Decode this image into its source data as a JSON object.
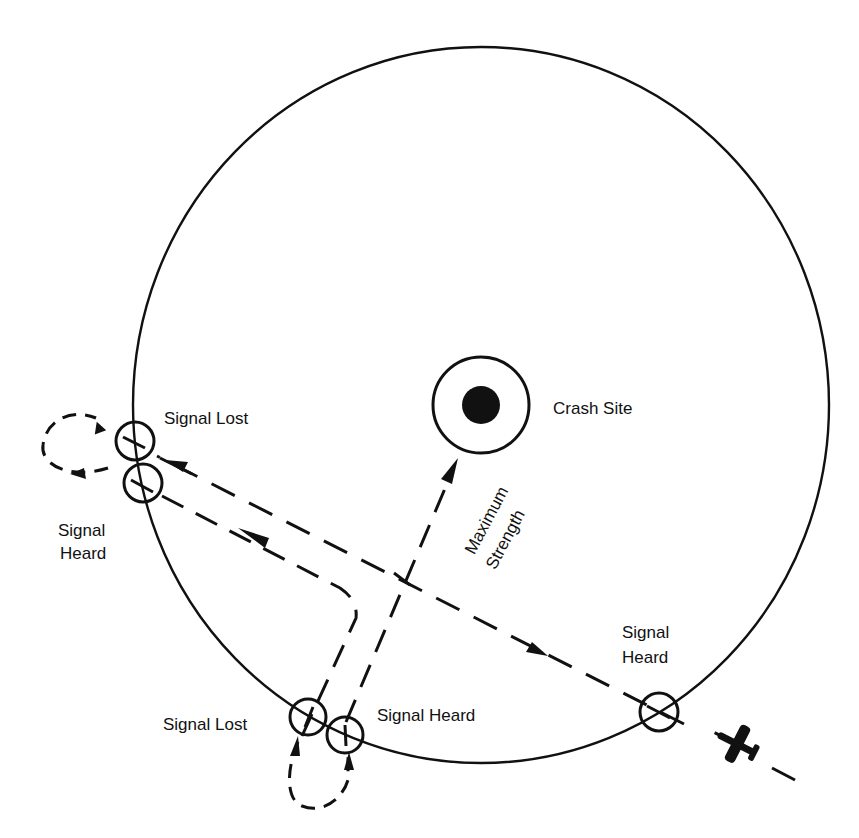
{
  "diagram": {
    "colors": {
      "ink": "#111111",
      "background": "#ffffff"
    },
    "labels": {
      "crash_site": "Crash Site",
      "max_strength_line1": "Maximum",
      "max_strength_line2": "Strength",
      "left_signal_lost": "Signal Lost",
      "left_signal_heard_line1": "Signal",
      "left_signal_heard_line2": "Heard",
      "bottom_signal_lost": "Signal Lost",
      "bottom_signal_heard": "Signal Heard",
      "right_signal_heard_line1": "Signal",
      "right_signal_heard_line2": "Heard"
    },
    "nodes": [
      {
        "id": "reception-boundary",
        "shape": "circle",
        "cx": 481,
        "cy": 405,
        "r": 352
      },
      {
        "id": "crash-site",
        "shape": "bullseye",
        "cx": 481,
        "cy": 405,
        "r": 48
      },
      {
        "id": "left-signal-lost",
        "shape": "marker-circle",
        "cx": 135,
        "cy": 441
      },
      {
        "id": "left-signal-heard",
        "shape": "marker-circle",
        "cx": 143,
        "cy": 483
      },
      {
        "id": "bottom-signal-lost",
        "shape": "marker-circle",
        "cx": 308,
        "cy": 717
      },
      {
        "id": "bottom-signal-heard",
        "shape": "marker-circle",
        "cx": 345,
        "cy": 735
      },
      {
        "id": "right-signal-heard",
        "shape": "marker-circle",
        "cx": 659,
        "cy": 712
      },
      {
        "id": "aircraft",
        "shape": "airplane-icon",
        "cx": 738,
        "cy": 744
      }
    ],
    "edges": [
      {
        "from": "aircraft",
        "to": "left-signal-lost",
        "style": "dashed",
        "label": "inbound leg"
      },
      {
        "from": "left-signal-heard",
        "to": "bottom-signal-lost",
        "style": "dashed",
        "label": "second leg"
      },
      {
        "from": "bottom-signal-heard",
        "to": "crash-site",
        "style": "dashed",
        "label": "Maximum Strength"
      }
    ]
  }
}
